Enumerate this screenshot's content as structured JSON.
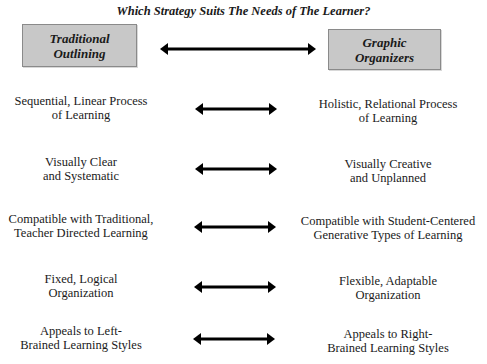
{
  "title": "Which Strategy Suits The Needs of The Learner?",
  "header": {
    "left": "Traditional\nOutlining",
    "right": "Graphic\nOrganizers",
    "box_color": "#c8c8c8"
  },
  "rows": [
    {
      "left": "Sequential, Linear Process\nof Learning",
      "right": "Holistic, Relational Process\nof Learning"
    },
    {
      "left": "Visually Clear\nand Systematic",
      "right": "Visually Creative\nand Unplanned"
    },
    {
      "left": "Compatible with Traditional,\nTeacher Directed Learning",
      "right": "Compatible with Student-Centered\nGenerative Types of Learning"
    },
    {
      "left": "Fixed, Logical\nOrganization",
      "right": "Flexible, Adaptable\nOrganization"
    },
    {
      "left": "Appeals to Left-\nBrained Learning Styles",
      "right": "Appeals to Right-\nBrained Learning Styles"
    }
  ],
  "icons": {
    "connector": "double-headed-arrow-icon"
  }
}
